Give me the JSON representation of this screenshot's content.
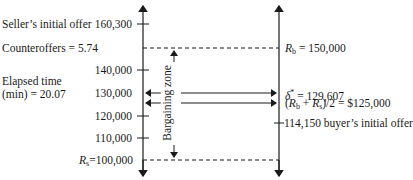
{
  "left_labels": {
    "seller_offer": "Seller’s initial offer",
    "counteroffers": "Counteroffers = 5.74",
    "elapsed_line1": "Elapsed time",
    "elapsed_line2": "(min) = 20.07"
  },
  "y_ticks": [
    {
      "label": "160,300",
      "y": 24
    },
    {
      "label": "140,000",
      "y": 70
    },
    {
      "label": "130,000",
      "y": 93
    },
    {
      "label": "120,000",
      "y": 116
    },
    {
      "label": "110,000",
      "y": 138
    }
  ],
  "rs_label": {
    "var": "R",
    "sub": "s",
    "value": "=100,000"
  },
  "bargaining_zone_label": "Bargaining zone",
  "right_labels": {
    "rb": {
      "var": "R",
      "sub": "b",
      "value": " = 150,000"
    },
    "delta": {
      "var": "δ",
      "sup": "*",
      "value": " = 129,607"
    },
    "midpoint": {
      "prefix": "(",
      "var1": "R",
      "sub1": "b",
      "plus": " + ",
      "var2": "R",
      "sub2": "s",
      "value": ")/2 = $125,000"
    },
    "buyer_offer": "114,150 buyer’s initial offer"
  },
  "diagram_values": {
    "seller_initial_offer": 160300,
    "buyer_reservation_Rb": 150000,
    "delta_star": 129607,
    "midpoint": 125000,
    "buyer_initial_offer": 114150,
    "seller_reservation_Rs": 100000,
    "counteroffers": 5.74,
    "elapsed_time_min": 20.07
  }
}
